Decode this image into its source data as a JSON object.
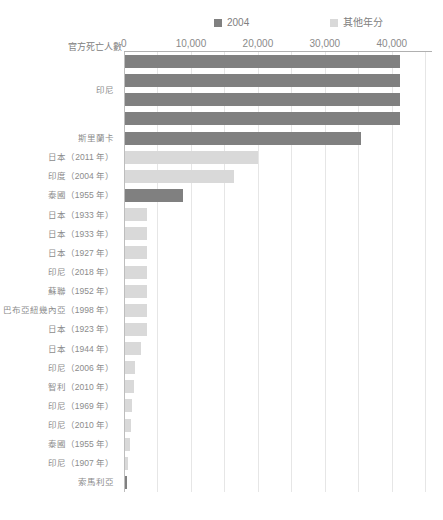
{
  "chart_data": {
    "type": "bar",
    "orientation": "horizontal",
    "title": "",
    "xlabel": "官方死亡人數",
    "ylabel": "",
    "xlim": [
      0,
      46000
    ],
    "grid": true,
    "grid_step": 5000,
    "legend_position": "top",
    "xticks": [
      "0",
      "10,000",
      "20,000",
      "30,000",
      "40,000"
    ],
    "xtick_values": [
      0,
      10000,
      20000,
      30000,
      40000
    ],
    "legend": [
      {
        "label": "2004",
        "color": "#808080"
      },
      {
        "label": "其他年分",
        "color": "#d9d9d9"
      }
    ],
    "categories": [
      "印尼",
      "",
      "",
      "",
      "斯里蘭卡",
      "日本（2011 年）",
      "印度（2004 年）",
      "泰國（1955 年）",
      "日本（1933 年）",
      "日本（1933 年）",
      "日本（1927 年）",
      "印尼（2018 年）",
      "蘇聯（1952 年）",
      "巴布亞紐幾內亞（1998 年）",
      "日本（1923 年）",
      "日本（1944 年）",
      "印尼（2006 年）",
      "智利（2010 年）",
      "印尼（1969 年）",
      "印尼（2010 年）",
      "泰國（1955 年）",
      "印尼（1907 年）",
      "索馬利亞"
    ],
    "values": [
      41000,
      41000,
      41000,
      41000,
      35200,
      19800,
      16300,
      8700,
      3300,
      3300,
      3300,
      3300,
      3300,
      3300,
      3300,
      2400,
      1500,
      1300,
      1100,
      900,
      700,
      500,
      300
    ],
    "series_of_bar": [
      "2004",
      "2004",
      "2004",
      "2004",
      "2004",
      "其他年分",
      "其他年分",
      "2004",
      "其他年分",
      "其他年分",
      "其他年分",
      "其他年分",
      "其他年分",
      "其他年分",
      "其他年分",
      "其他年分",
      "其他年分",
      "其他年分",
      "其他年分",
      "其他年分",
      "其他年分",
      "其他年分",
      "2004"
    ],
    "colors": {
      "series_2004": "#808080",
      "series_other": "#d9d9d9",
      "gridline": "#e6e6e6",
      "axis": "#bdbdbd",
      "text": "#8c8c8c",
      "background": "#ffffff"
    }
  }
}
